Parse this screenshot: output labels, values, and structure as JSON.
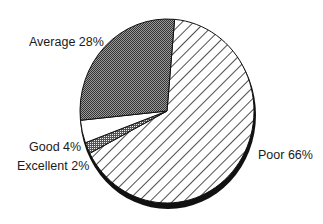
{
  "chart_data": {
    "type": "pie",
    "title": "",
    "categories": [
      "Poor",
      "Excellent",
      "Good",
      "Average"
    ],
    "values": [
      66,
      2,
      4,
      28
    ],
    "unit": "%",
    "labels": [
      {
        "category": "Poor",
        "text": "Poor 66%",
        "fill": "diagonal-hatch"
      },
      {
        "category": "Excellent",
        "text": "Excellent 2%",
        "fill": "dense-dots"
      },
      {
        "category": "Good",
        "text": "Good 4%",
        "fill": "white"
      },
      {
        "category": "Average",
        "text": "Average 28%",
        "fill": "dark-checker"
      }
    ],
    "start_angle_deg": 5,
    "direction": "clockwise",
    "style": "3d-shadow-edge, monochrome patterns",
    "legend": "none (direct labels)"
  },
  "labels": {
    "average": "Average 28%",
    "good": "Good 4%",
    "excellent": "Excellent 2%",
    "poor": "Poor 66%"
  },
  "colors": {
    "stroke": "#111111",
    "background": "#ffffff"
  }
}
